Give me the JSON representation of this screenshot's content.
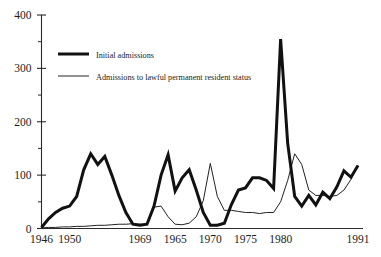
{
  "chart_data": {
    "type": "line",
    "title": "",
    "subtitle": "",
    "xlabel": "",
    "ylabel": "",
    "xlim": [
      1946,
      1991
    ],
    "ylim": [
      0,
      400
    ],
    "grid": false,
    "legend_position": "top-left",
    "y_ticks_major": [
      0,
      100,
      200,
      300,
      400
    ],
    "y_ticks_minor": [
      50,
      150,
      250,
      350
    ],
    "x_tick_labels": [
      "1946",
      "1950",
      "1969",
      "1965",
      "1970",
      "1975",
      "1980",
      "1991"
    ],
    "x_tick_values": [
      1946,
      1950,
      1960,
      1965,
      1970,
      1975,
      1980,
      1991
    ],
    "x": [
      1946,
      1947,
      1948,
      1949,
      1950,
      1951,
      1952,
      1953,
      1954,
      1955,
      1956,
      1957,
      1958,
      1959,
      1960,
      1961,
      1962,
      1963,
      1964,
      1965,
      1966,
      1967,
      1968,
      1969,
      1970,
      1971,
      1972,
      1973,
      1974,
      1975,
      1976,
      1977,
      1978,
      1979,
      1980,
      1981,
      1982,
      1983,
      1984,
      1985,
      1986,
      1987,
      1988,
      1989,
      1990,
      1991
    ],
    "series": [
      {
        "name": "Initial admissions",
        "style": "thick",
        "color": "#111111",
        "values": [
          2,
          18,
          30,
          38,
          42,
          60,
          110,
          140,
          120,
          135,
          100,
          62,
          30,
          8,
          6,
          8,
          42,
          100,
          138,
          70,
          95,
          110,
          72,
          30,
          6,
          6,
          10,
          45,
          72,
          76,
          95,
          95,
          90,
          75,
          355,
          160,
          60,
          42,
          62,
          44,
          68,
          56,
          78,
          108,
          96,
          118
        ],
        "labeled_peaks": [
          {
            "x": 1980,
            "y": 355
          },
          {
            "x": 1953,
            "y": 140
          },
          {
            "x": 1964,
            "y": 138
          }
        ]
      },
      {
        "name": "Admissions to lawful permanent resident status",
        "style": "thin",
        "color": "#222222",
        "values": [
          1,
          2,
          2,
          3,
          3,
          4,
          4,
          5,
          6,
          6,
          7,
          8,
          8,
          9,
          8,
          8,
          40,
          42,
          22,
          8,
          7,
          10,
          22,
          52,
          122,
          60,
          34,
          34,
          32,
          30,
          30,
          28,
          30,
          30,
          50,
          90,
          140,
          120,
          72,
          62,
          62,
          60,
          62,
          72,
          92,
          118
        ],
        "labeled_peaks": [
          {
            "x": 1982,
            "y": 140
          },
          {
            "x": 1970,
            "y": 122
          }
        ]
      }
    ]
  },
  "legend": {
    "entries": [
      {
        "label": "Initial admissions",
        "style": "thick"
      },
      {
        "label": "Admissions to lawful permanent resident status",
        "style": "thin"
      }
    ]
  },
  "axes": {
    "y_labels": [
      "400",
      "300",
      "200",
      "100",
      "0"
    ],
    "x_labels": [
      "1946",
      "1950",
      "1969",
      "1965",
      "1970",
      "1975",
      "1980",
      "1991"
    ]
  },
  "colors": {
    "background": "#ffffff",
    "axis": "#2b2b2b",
    "series_thick": "#111111",
    "series_thin": "#222222",
    "text": "#1c1c1c"
  }
}
